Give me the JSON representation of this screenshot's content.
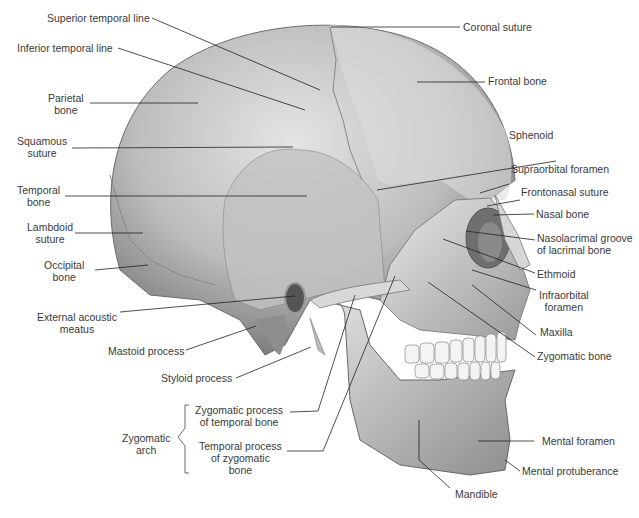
{
  "figure": {
    "background": "#ffffff",
    "bone_color": "#c9c9c9",
    "line_color": "#222222"
  },
  "labels": {
    "superior_temporal_line": "Superior temporal line",
    "inferior_temporal_line": "Inferior temporal line",
    "parietal_bone": [
      "Parietal",
      "bone"
    ],
    "squamous_suture": [
      "Squamous",
      "suture"
    ],
    "temporal_bone": [
      "Temporal",
      "bone"
    ],
    "lambdoid_suture": [
      "Lambdoid",
      "suture"
    ],
    "occipital_bone": [
      "Occipital",
      "bone"
    ],
    "external_acoustic_meatus": [
      "External acoustic",
      "meatus"
    ],
    "mastoid_process": "Mastoid process",
    "styloid_process": "Styloid process",
    "zygomatic_arch": [
      "Zygomatic",
      "arch"
    ],
    "zygomatic_process_of_temporal_bone": [
      "Zygomatic process",
      "of temporal bone"
    ],
    "temporal_process_of_zygomatic_bone": [
      "Temporal process",
      "of zygomatic",
      "bone"
    ],
    "coronal_suture": "Coronal suture",
    "frontal_bone": "Frontal bone",
    "sphenoid": "Sphenoid",
    "supraorbital_foramen": "Supraorbital foramen",
    "frontonasal_suture": "Frontonasal suture",
    "nasal_bone": "Nasal bone",
    "nasolacrimal_groove": [
      "Nasolacrimal groove",
      "of lacrimal bone"
    ],
    "ethmoid": "Ethmoid",
    "infraorbital_foramen": [
      "Infraorbital",
      "foramen"
    ],
    "maxilla": "Maxilla",
    "zygomatic_bone": "Zygomatic bone",
    "mental_foramen": "Mental foramen",
    "mental_protuberance": "Mental protuberance",
    "mandible": "Mandible"
  }
}
